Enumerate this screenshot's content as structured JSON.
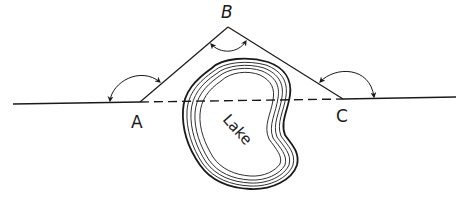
{
  "diagram": {
    "type": "surveying-offset-around-obstacle",
    "points": {
      "A": {
        "label": "A"
      },
      "B": {
        "label": "B"
      },
      "C": {
        "label": "C"
      }
    },
    "obstacle": {
      "label": "Lake"
    },
    "colors": {
      "ink": "#1a1a1a",
      "background": "#ffffff"
    }
  }
}
